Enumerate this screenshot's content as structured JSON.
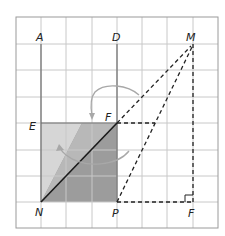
{
  "colors": {
    "grid": "#c8c8c8",
    "border": "#9a9a9a",
    "axis_line": "#6e6e6e",
    "shade_light": "#d4d4d4",
    "shade_mid": "#b5b5b5",
    "shade_dark": "#9c9c9c",
    "diagonal": "#1a1a1a",
    "dashed": "#222222",
    "arrow": "#a8a8a8"
  },
  "grid": {
    "x": [
      16,
      41,
      66,
      92,
      117,
      142,
      167,
      193,
      218
    ],
    "y": [
      17,
      44,
      70,
      97,
      123,
      150,
      176,
      202,
      228
    ]
  },
  "points": {
    "A": {
      "label": "A",
      "x": 41,
      "y": 44
    },
    "D": {
      "label": "D",
      "x": 117,
      "y": 44
    },
    "M": {
      "label": "M",
      "x": 193,
      "y": 44
    },
    "E": {
      "label": "E",
      "x": 41,
      "y": 123
    },
    "F_top": {
      "label": "F",
      "x": 117,
      "y": 123
    },
    "N": {
      "label": "N",
      "x": 41,
      "y": 202
    },
    "P": {
      "label": "P",
      "x": 117,
      "y": 202
    },
    "F_right": {
      "label": "F",
      "x": 193,
      "y": 202
    }
  },
  "labels": {
    "A": "A",
    "D": "D",
    "M": "M",
    "E": "E",
    "F_top": "F",
    "N": "N",
    "P": "P",
    "F_right": "F"
  }
}
